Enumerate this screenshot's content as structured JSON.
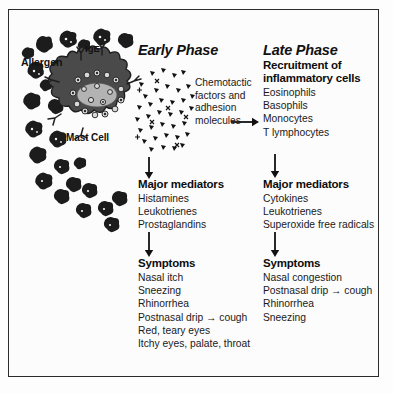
{
  "figure": {
    "background": "#fcfcfc",
    "ink": "#111111"
  },
  "cell_diagram": {
    "allergen_label": "Allergen",
    "ige_label": "IgE",
    "mast_cell_label": "Mast Cell",
    "mast_cell_color": "#4a4a4a",
    "nucleus_color": "#b0b0b0",
    "allergen_color": "#1c1c1c",
    "mediator_particle_color": "#111111",
    "allergen_count": 26,
    "mediator_particle_count": 44
  },
  "early_phase": {
    "heading": "Early Phase",
    "chemotactic_note": "Chemotactic factors and adhesion molecules",
    "mediators": {
      "heading": "Major mediators",
      "items": [
        "Histamines",
        "Leukotrienes",
        "Prostaglandins"
      ]
    },
    "symptoms": {
      "heading": "Symptoms",
      "items": [
        "Nasal itch",
        "Sneezing",
        "Rhinorrhea",
        "Postnasal drip → cough",
        "Red, teary eyes",
        "Itchy eyes, palate, throat"
      ]
    }
  },
  "late_phase": {
    "heading": "Late Phase",
    "recruitment": {
      "heading": "Recruitment of inflammatory cells",
      "items": [
        "Eosinophils",
        "Basophils",
        "Monocytes",
        "T lymphocytes"
      ]
    },
    "mediators": {
      "heading": "Major mediators",
      "items": [
        "Cytokines",
        "Leukotrienes",
        "Superoxide free radicals"
      ]
    },
    "symptoms": {
      "heading": "Symptoms",
      "items": [
        "Nasal congestion",
        "Postnasal drip → cough",
        "Rhinorrhea",
        "Sneezing"
      ]
    }
  },
  "arrows": {
    "early_to_mediators": "down-arrow",
    "early_mediators_to_symptoms": "down-arrow",
    "early_to_late": "right-arrow",
    "late_to_mediators": "down-arrow",
    "late_mediators_to_symptoms": "down-arrow"
  }
}
